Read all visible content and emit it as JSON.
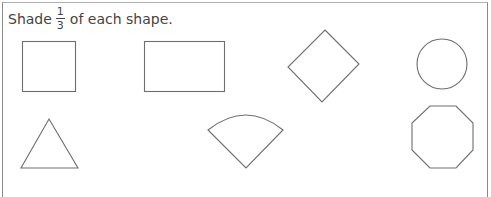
{
  "worksheet": {
    "instruction": {
      "prefix": "Shade",
      "fraction": {
        "numerator": "1",
        "denominator": "3"
      },
      "suffix": "of each shape."
    },
    "shapes": [
      {
        "name": "square"
      },
      {
        "name": "rectangle"
      },
      {
        "name": "diamond"
      },
      {
        "name": "circle"
      },
      {
        "name": "triangle"
      },
      {
        "name": "circle-sector"
      },
      {
        "name": "octagon"
      }
    ],
    "stroke_color": "#6e6e6e"
  }
}
